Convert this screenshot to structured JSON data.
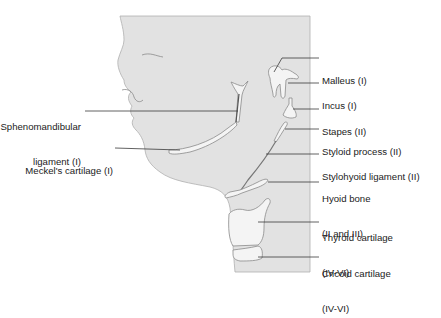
{
  "figure": {
    "background": "#ffffff",
    "panel_color": "#e2e2e2",
    "structure_fill": "#f4f4f4",
    "outline_color": "#8a8a8a",
    "leader_color": "#3a3a3a"
  },
  "labels_left": [
    {
      "id": "sphenomandibular",
      "line1": "Sphenomandibular",
      "line2": "ligament (I)"
    },
    {
      "id": "meckels",
      "line1": "Meckel's cartilage (I)"
    }
  ],
  "labels_right": [
    {
      "id": "malleus",
      "line1": "Malleus (I)"
    },
    {
      "id": "incus",
      "line1": "Incus (I)"
    },
    {
      "id": "stapes",
      "line1": "Stapes (II)"
    },
    {
      "id": "styloid",
      "line1": "Styloid process (II)"
    },
    {
      "id": "stylohyoid",
      "line1": "Stylohyoid ligament (II)"
    },
    {
      "id": "hyoid",
      "line1": "Hyoid bone",
      "line2": "(II and III)"
    },
    {
      "id": "thyroid",
      "line1": "Thyroid cartilage",
      "line2": "(IV-VI)"
    },
    {
      "id": "cricoid",
      "line1": "Cricoid cartilage",
      "line2": "(IV-VI)"
    }
  ]
}
